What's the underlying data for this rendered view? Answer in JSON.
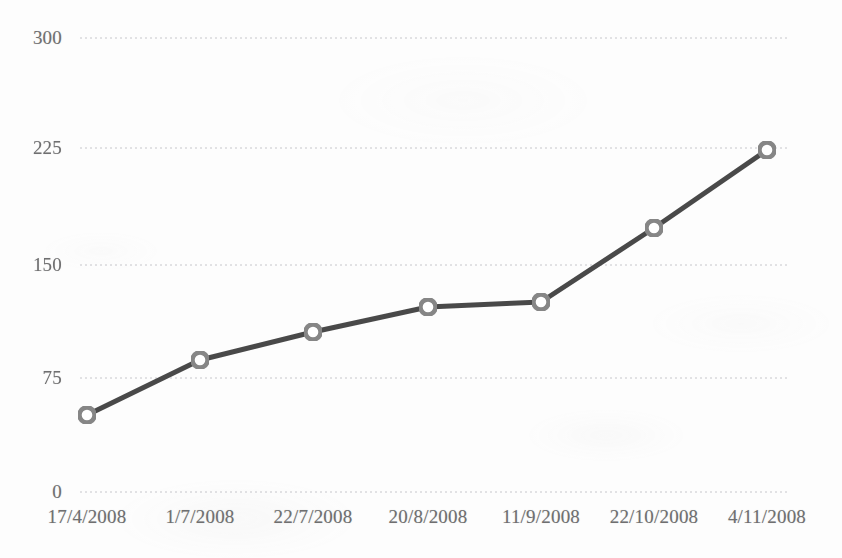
{
  "chart_data": {
    "type": "line",
    "title": "",
    "subtitle": "",
    "xlabel": "",
    "ylabel": "",
    "categories": [
      "17/4/2008",
      "1/7/2008",
      "22/7/2008",
      "20/8/2008",
      "11/9/2008",
      "22/10/2008",
      "4/11/2008"
    ],
    "values": [
      51,
      87,
      106,
      122,
      126,
      175,
      225
    ],
    "series": [
      {
        "name": "series-1",
        "values": [
          51,
          87,
          106,
          122,
          126,
          175,
          225
        ]
      }
    ],
    "ylim": [
      0,
      300
    ],
    "y_ticks": [
      0,
      75,
      150,
      225,
      300
    ],
    "y_tick_labels": [
      "0",
      "75",
      "150",
      "225",
      "300"
    ],
    "x_tick_labels": [
      "17/4/2008",
      "1/7/2008",
      "22/7/2008",
      "20/8/2008",
      "11/9/2008",
      "22/10/2008",
      "4/11/2008"
    ],
    "grid": {
      "horizontal": true,
      "vertical": false,
      "style": "dashed"
    },
    "legend": {
      "visible": false,
      "position": "none",
      "entries": []
    },
    "markers": {
      "shape": "circle",
      "filled": false,
      "size": 20
    },
    "annotations": []
  },
  "style": {
    "background_color": "#fdfdfd",
    "line_color": "#4a4a4a",
    "marker_edge_color": "#868686",
    "marker_fill_color": "#ffffff",
    "grid_color": "#b8b8bd",
    "tick_label_color": "#6f6f70",
    "axis_color": "#b8b8bd"
  },
  "geometry": {
    "plot_left": 80,
    "plot_right": 790,
    "plot_top": 38,
    "plot_bottom": 492,
    "point_x": [
      87,
      200,
      313,
      428,
      541,
      654,
      767
    ],
    "point_y": [
      415,
      360,
      332,
      307,
      302,
      228,
      150
    ],
    "y_tick_y": [
      492,
      378,
      265,
      148,
      38
    ],
    "y_label_x": 62,
    "x_label_y": 506
  }
}
